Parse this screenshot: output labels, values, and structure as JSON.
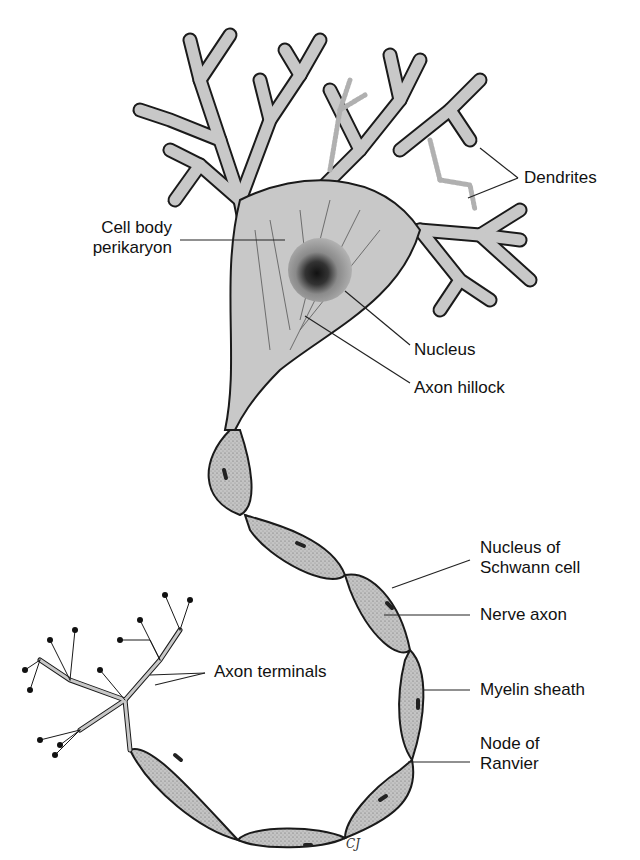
{
  "figure": {
    "colors": {
      "cell_fill": "#c8c8c8",
      "outline": "#1a1a1a",
      "myelin_fill": "#bdbdbd",
      "background": "#ffffff",
      "label_text": "#111111"
    }
  },
  "labels": {
    "dendrites": "Dendrites",
    "cell_body_line1": "Cell body",
    "cell_body_line2": "perikaryon",
    "nucleus": "Nucleus",
    "axon_hillock": "Axon hillock",
    "schwann_line1": "Nucleus of",
    "schwann_line2": "Schwann cell",
    "nerve_axon": "Nerve axon",
    "axon_terminals": "Axon terminals",
    "myelin_sheath": "Myelin sheath",
    "node_line1": "Node of",
    "node_line2": "Ranvier"
  },
  "signature": "CJ"
}
